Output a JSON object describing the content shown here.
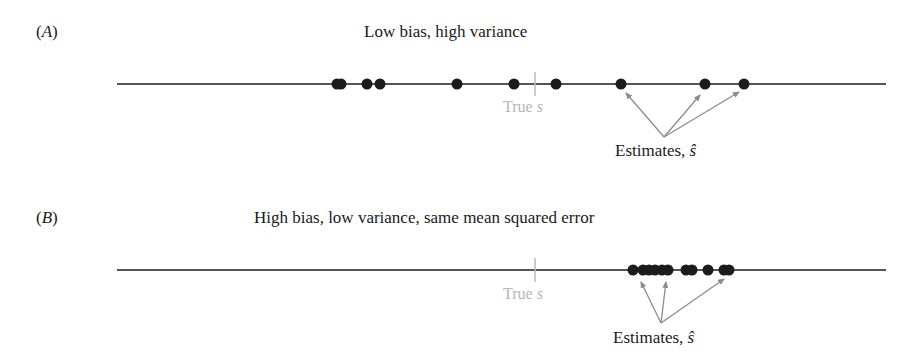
{
  "panels": [
    {
      "id": "A",
      "label": "A",
      "title": "Low bias, high variance",
      "true_label": "True ",
      "true_symbol": "s",
      "estimates_label": "Estimates, ",
      "estimates_symbol": "ŝ"
    },
    {
      "id": "B",
      "label": "B",
      "title": "High bias, low variance, same mean squared error",
      "true_label": "True ",
      "true_symbol": "s",
      "estimates_label": "Estimates, ",
      "estimates_symbol": "ŝ"
    }
  ],
  "colors": {
    "line": "#555555",
    "dot": "#1c1c1c",
    "true_marker": "#bbbbbb",
    "arrow": "#8c8c8c"
  },
  "geometry": {
    "line_x_start": 117,
    "line_x_end": 886,
    "true_x": 535,
    "panel_A": {
      "line_y": 84,
      "dots_x": [
        337,
        341,
        367,
        380,
        457,
        514,
        556,
        621,
        705,
        744
      ],
      "arrow_origin": [
        664,
        137
      ],
      "arrow_targets": [
        [
          626,
          93
        ],
        [
          700,
          95
        ],
        [
          739,
          92
        ]
      ]
    },
    "panel_B": {
      "line_y": 270,
      "dots_x": [
        633,
        643,
        649,
        655,
        662,
        668,
        686,
        692,
        708,
        724,
        729
      ],
      "arrow_origin": [
        661,
        323
      ],
      "arrow_targets": [
        [
          641,
          282
        ],
        [
          666,
          282
        ],
        [
          724,
          279
        ]
      ]
    }
  }
}
